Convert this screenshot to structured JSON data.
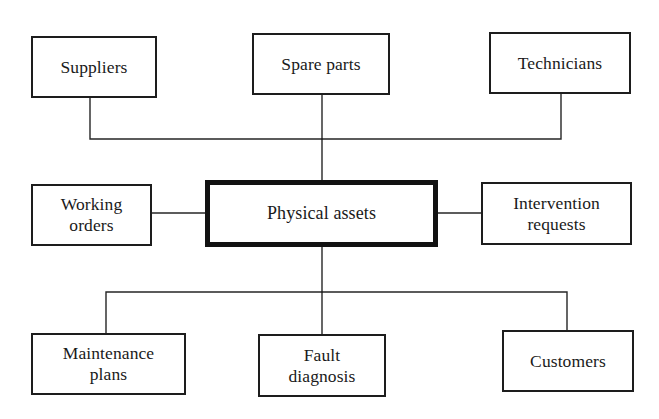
{
  "diagram": {
    "background_color": "#ffffff",
    "line_color": "#262626",
    "box_border_color": "#1d1d1d",
    "center_border_color": "#121212",
    "nodes": [
      {
        "id": "suppliers",
        "label": "Suppliers",
        "row": "top",
        "x": 31,
        "y": 36,
        "w": 126,
        "h": 62,
        "emphasis": false
      },
      {
        "id": "spare-parts",
        "label": "Spare parts",
        "row": "top",
        "x": 252,
        "y": 33,
        "w": 138,
        "h": 62,
        "emphasis": false
      },
      {
        "id": "technicians",
        "label": "Technicians",
        "row": "top",
        "x": 489,
        "y": 32,
        "w": 142,
        "h": 62,
        "emphasis": false
      },
      {
        "id": "working-orders",
        "label": "Working\norders",
        "row": "middle",
        "x": 31,
        "y": 184,
        "w": 121,
        "h": 62,
        "emphasis": false
      },
      {
        "id": "physical-assets",
        "label": "Physical assets",
        "row": "middle",
        "x": 205,
        "y": 180,
        "w": 233,
        "h": 67,
        "emphasis": true
      },
      {
        "id": "intervention-requests",
        "label": "Intervention\nrequests",
        "row": "middle",
        "x": 481,
        "y": 182,
        "w": 151,
        "h": 63,
        "emphasis": false
      },
      {
        "id": "maintenance-plans",
        "label": "Maintenance\nplans",
        "row": "bottom",
        "x": 31,
        "y": 333,
        "w": 155,
        "h": 62,
        "emphasis": false
      },
      {
        "id": "fault-diagnosis",
        "label": "Fault\ndiagnosis",
        "row": "bottom",
        "x": 258,
        "y": 334,
        "w": 128,
        "h": 63,
        "emphasis": false
      },
      {
        "id": "customers",
        "label": "Customers",
        "row": "bottom",
        "x": 502,
        "y": 330,
        "w": 132,
        "h": 62,
        "emphasis": false
      }
    ],
    "connectors": [
      {
        "id": "suppliers-to-bus",
        "from": "suppliers",
        "to": "physical-assets",
        "points": "90,98 90,139 322,139"
      },
      {
        "id": "technicians-to-bus",
        "from": "technicians",
        "to": "physical-assets",
        "points": "561,94 561,139 322,139"
      },
      {
        "id": "spare-parts-to-center",
        "from": "spare-parts",
        "to": "physical-assets",
        "points": "322,95 322,180"
      },
      {
        "id": "working-orders-to-center",
        "from": "working-orders",
        "to": "physical-assets",
        "points": "152,213 205,213"
      },
      {
        "id": "center-to-intervention-requests",
        "from": "physical-assets",
        "to": "intervention-requests",
        "points": "438,213 481,213"
      },
      {
        "id": "center-to-bottom-bus",
        "from": "physical-assets",
        "to": "fault-diagnosis",
        "points": "322,247 322,334"
      },
      {
        "id": "bottom-bus-to-maintenance-plans",
        "from": "physical-assets",
        "to": "maintenance-plans",
        "points": "322,292 106,292 106,333"
      },
      {
        "id": "bottom-bus-to-customers",
        "from": "physical-assets",
        "to": "customers",
        "points": "322,292 567,292 567,330"
      }
    ]
  }
}
